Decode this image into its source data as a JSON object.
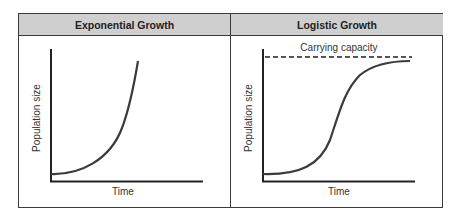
{
  "panels": [
    {
      "title": "Exponential Growth",
      "xlabel": "Time",
      "ylabel": "Population size"
    },
    {
      "title": "Logistic Growth",
      "xlabel": "Time",
      "ylabel": "Population size",
      "annotation": "Carrying capacity"
    }
  ],
  "colors": {
    "header_bg": "#cfcfcf",
    "border": "#3a3a3a",
    "curve": "#3b3b3b"
  }
}
